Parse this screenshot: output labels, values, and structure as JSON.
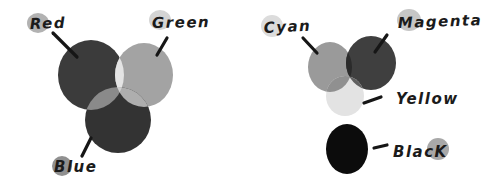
{
  "figure": {
    "background": "#ffffff",
    "ink_color": "#1b1b1b",
    "line_color": "#161616",
    "rgb_diagram": {
      "labels": {
        "red": "Red",
        "green": "Green",
        "blue": "Blue"
      },
      "colors": {
        "red": "#3b3b3b",
        "green": "#a3a3a3",
        "blue": "#333333",
        "red_green_overlap": "#e4e4e4",
        "red_blue_overlap": "#8a8a8a",
        "green_blue_overlap": "#aeaeae",
        "triple_overlap": "#cfcfcf",
        "red_label_highlight": "#b2b2b2",
        "green_label_highlight": "#d4d4d4",
        "blue_label_highlight": "#909090"
      }
    },
    "cmyk_diagram": {
      "labels": {
        "cyan": "Cyan",
        "magenta": "Magenta",
        "yellow": "Yellow",
        "black": "BlacK"
      },
      "colors": {
        "cyan": "#9a9a9a",
        "magenta": "#3f3f3f",
        "yellow": "#e3e3e3",
        "black": "#0c0c0c",
        "cyan_magenta_overlap": "#2b2b2b",
        "cyan_yellow_overlap": "#909090",
        "magenta_yellow_overlap": "#606060",
        "triple_overlap": "#6f6f6f",
        "cyan_label_highlight": "#dcdcdc",
        "magenta_label_highlight": "#c6c6c6",
        "black_label_highlight": "#a8a8a8"
      }
    }
  }
}
